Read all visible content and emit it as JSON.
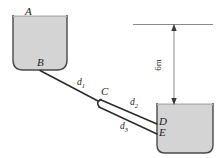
{
  "figure": {
    "colors": {
      "tank_fill": "#d4d4d4",
      "tank_outline": "#4a4a4a",
      "pipe_line": "#2b2b2b",
      "dimension_line": "#8a8a8a",
      "text": "#1c1c1c",
      "background": "#ffffff"
    },
    "labels": {
      "point_a": "A",
      "point_b": "B",
      "point_c": "C",
      "point_d": "D",
      "point_e": "E",
      "pipe_1": "d",
      "pipe_1_sub": "1",
      "pipe_2": "d",
      "pipe_2_sub": "2",
      "pipe_3": "d",
      "pipe_3_sub": "3",
      "height_dimension": "6m"
    },
    "elements": {
      "upper_tank_name": "upper-reservoir",
      "lower_tank_name": "lower-reservoir",
      "datum_line_name": "datum-line",
      "dimension_name": "height-dimension"
    }
  }
}
